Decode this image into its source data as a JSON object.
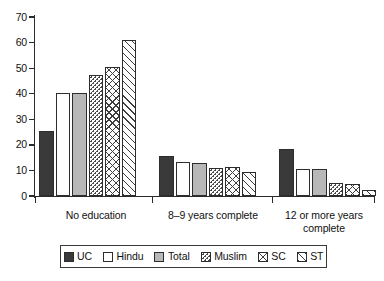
{
  "chart_data": {
    "type": "bar",
    "title": "",
    "subtitle": "",
    "xlabel": "",
    "ylabel": "",
    "ylim": [
      0,
      70
    ],
    "yticks": [
      0,
      10,
      20,
      30,
      40,
      50,
      60,
      70
    ],
    "grid": false,
    "legend_position": "bottom",
    "categories": [
      "No education",
      "8–9 years complete",
      "12 or more years complete"
    ],
    "series": [
      {
        "name": "UC",
        "pattern": "solid-dark",
        "values": [
          25.4,
          15.5,
          18.4
        ]
      },
      {
        "name": "Hindu",
        "pattern": "white",
        "values": [
          40.2,
          13.3,
          10.6
        ]
      },
      {
        "name": "Total",
        "pattern": "light-gray",
        "values": [
          40.2,
          13.0,
          10.4
        ]
      },
      {
        "name": "Muslim",
        "pattern": "dotted",
        "values": [
          47.5,
          11.0,
          5.0
        ]
      },
      {
        "name": "SC",
        "pattern": "crosshatch",
        "values": [
          50.4,
          11.3,
          4.7
        ]
      },
      {
        "name": "ST",
        "pattern": "diagonal",
        "values": [
          61.2,
          9.2,
          2.2
        ]
      }
    ]
  },
  "axis": {
    "y_tick_labels": [
      "70",
      "60",
      "50",
      "40",
      "30",
      "20",
      "10",
      "0"
    ]
  },
  "legend": {
    "items": [
      {
        "label": "UC"
      },
      {
        "label": "Hindu"
      },
      {
        "label": "Total"
      },
      {
        "label": "Muslim"
      },
      {
        "label": "SC"
      },
      {
        "label": "ST"
      }
    ]
  },
  "colors": {
    "uc": "#3a3a3a",
    "hindu": "#ffffff",
    "total": "#b8b8b8",
    "muslim": "#ffffff",
    "sc": "#ffffff",
    "st": "#ffffff",
    "axis": "#2b2b2b",
    "outline": "#2d2d2d",
    "background": "#ffffff"
  }
}
